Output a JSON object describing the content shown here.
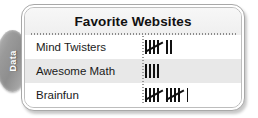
{
  "side_tab": {
    "label": "Data",
    "icon": "data-tab-oval",
    "color": "#9a9a9a"
  },
  "table": {
    "title": "Favorite Websites",
    "accent_color": "#111111",
    "shaded_row_color": "#e8e8e8",
    "columns": [
      "Website",
      "Tally"
    ],
    "rows": [
      {
        "label": "Mind Twisters",
        "count": 7,
        "tally_text": "̶|||| ||",
        "shaded": false
      },
      {
        "label": "Awesome Math",
        "count": 4,
        "tally_text": "||||",
        "shaded": true
      },
      {
        "label": "Brainfun",
        "count": 11,
        "tally_text": "̶|||| ̶|||| |",
        "shaded": false
      }
    ]
  },
  "chart_data": {
    "type": "table",
    "title": "Favorite Websites",
    "xlabel": "Website",
    "ylabel": "Votes (tally marks)",
    "categories": [
      "Mind Twisters",
      "Awesome Math",
      "Brainfun"
    ],
    "values": [
      7,
      4,
      11
    ],
    "tally_representation": [
      "5+2",
      "4",
      "5+5+1"
    ],
    "grid": false,
    "legend": "none"
  }
}
